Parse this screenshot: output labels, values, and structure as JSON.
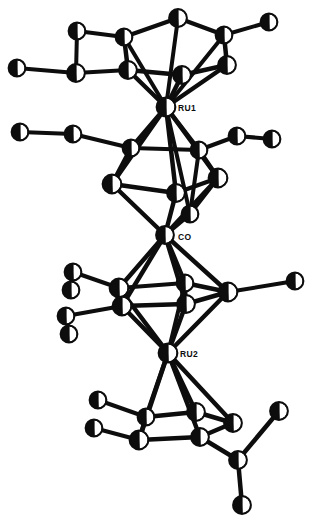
{
  "figure": {
    "type": "crystallographic-structure-diagram",
    "background_color": "#ffffff",
    "line_color": "#0d0d0d",
    "atom_fill_color": "#0d0d0d",
    "atom_highlight_color": "#ffffff",
    "width": 314,
    "height": 530
  },
  "labels": [
    {
      "id": "label-ru1",
      "text": "RU1",
      "x": 178,
      "y": 111
    },
    {
      "id": "label-co",
      "text": "CO",
      "x": 178,
      "y": 240
    },
    {
      "id": "label-ru2",
      "text": "RU2",
      "x": 180,
      "y": 357
    }
  ],
  "metal_atoms": [
    {
      "id": "RU1",
      "label": "RU1",
      "x": 166,
      "y": 107,
      "r": 9.5
    },
    {
      "id": "CO",
      "label": "CO",
      "x": 165,
      "y": 235,
      "r": 9.0
    },
    {
      "id": "RU2",
      "label": "RU2",
      "x": 168,
      "y": 353,
      "r": 9.5
    }
  ],
  "atoms": [
    {
      "id": "C1",
      "x": 178,
      "y": 18,
      "r": 9.0
    },
    {
      "id": "C2",
      "x": 124,
      "y": 37,
      "r": 8.5
    },
    {
      "id": "C3",
      "x": 224,
      "y": 35,
      "r": 8.5
    },
    {
      "id": "C4",
      "x": 128,
      "y": 70,
      "r": 9.0
    },
    {
      "id": "C5",
      "x": 227,
      "y": 65,
      "r": 9.0
    },
    {
      "id": "C6",
      "x": 182,
      "y": 75,
      "r": 9.0
    },
    {
      "id": "M1",
      "x": 77,
      "y": 31,
      "r": 8.5
    },
    {
      "id": "M2",
      "x": 269,
      "y": 22,
      "r": 8.5
    },
    {
      "id": "M3",
      "x": 17,
      "y": 68,
      "r": 8.5
    },
    {
      "id": "M4",
      "x": 76,
      "y": 73,
      "r": 9.0
    },
    {
      "id": "B1",
      "x": 131,
      "y": 148,
      "r": 8.5
    },
    {
      "id": "B2",
      "x": 199,
      "y": 150,
      "r": 8.5
    },
    {
      "id": "B3",
      "x": 112,
      "y": 184,
      "r": 9.5
    },
    {
      "id": "B4",
      "x": 218,
      "y": 178,
      "r": 9.5
    },
    {
      "id": "B5",
      "x": 176,
      "y": 193,
      "r": 9.0
    },
    {
      "id": "B6",
      "x": 190,
      "y": 214,
      "r": 8.5
    },
    {
      "id": "M5",
      "x": 73,
      "y": 134,
      "r": 8.5
    },
    {
      "id": "M6",
      "x": 20,
      "y": 132,
      "r": 8.5
    },
    {
      "id": "M7",
      "x": 237,
      "y": 136,
      "r": 8.5
    },
    {
      "id": "M8",
      "x": 272,
      "y": 139,
      "r": 8.5
    },
    {
      "id": "D1",
      "x": 119,
      "y": 288,
      "r": 9.5
    },
    {
      "id": "D2",
      "x": 122,
      "y": 306,
      "r": 9.5
    },
    {
      "id": "D3",
      "x": 185,
      "y": 283,
      "r": 8.5
    },
    {
      "id": "D4",
      "x": 186,
      "y": 304,
      "r": 9.0
    },
    {
      "id": "D5",
      "x": 228,
      "y": 292,
      "r": 9.5
    },
    {
      "id": "M9",
      "x": 73,
      "y": 272,
      "r": 8.5
    },
    {
      "id": "M10",
      "x": 71,
      "y": 290,
      "r": 8.5
    },
    {
      "id": "M11",
      "x": 66,
      "y": 316,
      "r": 8.5
    },
    {
      "id": "M12",
      "x": 69,
      "y": 334,
      "r": 8.5
    },
    {
      "id": "M13",
      "x": 295,
      "y": 281,
      "r": 8.5
    },
    {
      "id": "E1",
      "x": 146,
      "y": 417,
      "r": 8.5
    },
    {
      "id": "E2",
      "x": 139,
      "y": 440,
      "r": 9.5
    },
    {
      "id": "E3",
      "x": 196,
      "y": 412,
      "r": 9.0
    },
    {
      "id": "E4",
      "x": 200,
      "y": 437,
      "r": 9.0
    },
    {
      "id": "E5",
      "x": 233,
      "y": 423,
      "r": 9.0
    },
    {
      "id": "M14",
      "x": 98,
      "y": 400,
      "r": 8.5
    },
    {
      "id": "M15",
      "x": 94,
      "y": 428,
      "r": 8.5
    },
    {
      "id": "M16",
      "x": 238,
      "y": 460,
      "r": 9.0
    },
    {
      "id": "M17",
      "x": 279,
      "y": 411,
      "r": 9.0
    },
    {
      "id": "M18",
      "x": 242,
      "y": 505,
      "r": 9.0
    }
  ],
  "bonds": [
    {
      "from": "C1",
      "to": "C2",
      "w": 4.5
    },
    {
      "from": "C1",
      "to": "C3",
      "w": 4.5
    },
    {
      "from": "C2",
      "to": "C4",
      "w": 4.5
    },
    {
      "from": "C3",
      "to": "C5",
      "w": 4.5
    },
    {
      "from": "C4",
      "to": "C6",
      "w": 4.5
    },
    {
      "from": "C5",
      "to": "C6",
      "w": 4.5
    },
    {
      "from": "C2",
      "to": "M1",
      "w": 4.0
    },
    {
      "from": "C3",
      "to": "M2",
      "w": 4.0
    },
    {
      "from": "C4",
      "to": "M4",
      "w": 4.0
    },
    {
      "from": "M4",
      "to": "M3",
      "w": 4.0
    },
    {
      "from": "M1",
      "to": "M4",
      "w": 4.0
    },
    {
      "from": "C1",
      "to": "RU1",
      "w": 4.0
    },
    {
      "from": "C2",
      "to": "RU1",
      "w": 4.0
    },
    {
      "from": "C3",
      "to": "RU1",
      "w": 4.0
    },
    {
      "from": "C4",
      "to": "RU1",
      "w": 4.5
    },
    {
      "from": "C5",
      "to": "RU1",
      "w": 4.5
    },
    {
      "from": "C6",
      "to": "RU1",
      "w": 4.5
    },
    {
      "from": "RU1",
      "to": "B1",
      "w": 4.5
    },
    {
      "from": "RU1",
      "to": "B2",
      "w": 4.5
    },
    {
      "from": "RU1",
      "to": "B3",
      "w": 4.5
    },
    {
      "from": "RU1",
      "to": "B4",
      "w": 4.5
    },
    {
      "from": "RU1",
      "to": "B5",
      "w": 4.5
    },
    {
      "from": "RU1",
      "to": "B6",
      "w": 4.0
    },
    {
      "from": "B1",
      "to": "B2",
      "w": 4.0
    },
    {
      "from": "B1",
      "to": "B3",
      "w": 4.5
    },
    {
      "from": "B2",
      "to": "B4",
      "w": 4.5
    },
    {
      "from": "B3",
      "to": "B5",
      "w": 4.5
    },
    {
      "from": "B4",
      "to": "B5",
      "w": 4.5
    },
    {
      "from": "B2",
      "to": "B6",
      "w": 4.0
    },
    {
      "from": "B4",
      "to": "B6",
      "w": 4.0
    },
    {
      "from": "B1",
      "to": "M5",
      "w": 4.0
    },
    {
      "from": "M5",
      "to": "M6",
      "w": 4.0
    },
    {
      "from": "B2",
      "to": "M7",
      "w": 4.0
    },
    {
      "from": "M7",
      "to": "M8",
      "w": 4.0
    },
    {
      "from": "B3",
      "to": "CO",
      "w": 4.5
    },
    {
      "from": "B4",
      "to": "CO",
      "w": 4.5
    },
    {
      "from": "B5",
      "to": "CO",
      "w": 4.5
    },
    {
      "from": "B6",
      "to": "CO",
      "w": 4.5
    },
    {
      "from": "CO",
      "to": "D1",
      "w": 4.5
    },
    {
      "from": "CO",
      "to": "D2",
      "w": 4.5
    },
    {
      "from": "CO",
      "to": "D3",
      "w": 4.5
    },
    {
      "from": "CO",
      "to": "D4",
      "w": 4.5
    },
    {
      "from": "CO",
      "to": "D5",
      "w": 4.5
    },
    {
      "from": "D1",
      "to": "D3",
      "w": 4.0
    },
    {
      "from": "D2",
      "to": "D4",
      "w": 4.5
    },
    {
      "from": "D3",
      "to": "D5",
      "w": 4.5
    },
    {
      "from": "D4",
      "to": "D5",
      "w": 4.5
    },
    {
      "from": "D1",
      "to": "D2",
      "w": 4.5
    },
    {
      "from": "D3",
      "to": "D4",
      "w": 4.0
    },
    {
      "from": "D1",
      "to": "M9",
      "w": 4.0
    },
    {
      "from": "M9",
      "to": "M10",
      "w": 4.0
    },
    {
      "from": "D2",
      "to": "M11",
      "w": 4.0
    },
    {
      "from": "M11",
      "to": "M12",
      "w": 4.0
    },
    {
      "from": "D5",
      "to": "M13",
      "w": 4.0
    },
    {
      "from": "D1",
      "to": "RU2",
      "w": 4.5
    },
    {
      "from": "D2",
      "to": "RU2",
      "w": 4.5
    },
    {
      "from": "D4",
      "to": "RU2",
      "w": 4.5
    },
    {
      "from": "D5",
      "to": "RU2",
      "w": 4.5
    },
    {
      "from": "D3",
      "to": "RU2",
      "w": 4.0
    },
    {
      "from": "RU2",
      "to": "E1",
      "w": 4.5
    },
    {
      "from": "RU2",
      "to": "E2",
      "w": 4.5
    },
    {
      "from": "RU2",
      "to": "E3",
      "w": 4.5
    },
    {
      "from": "RU2",
      "to": "E4",
      "w": 4.5
    },
    {
      "from": "RU2",
      "to": "E5",
      "w": 4.5
    },
    {
      "from": "E1",
      "to": "E3",
      "w": 4.5
    },
    {
      "from": "E2",
      "to": "E4",
      "w": 4.5
    },
    {
      "from": "E3",
      "to": "E5",
      "w": 4.5
    },
    {
      "from": "E4",
      "to": "E5",
      "w": 4.5
    },
    {
      "from": "E1",
      "to": "E2",
      "w": 4.5
    },
    {
      "from": "E1",
      "to": "M14",
      "w": 4.0
    },
    {
      "from": "E2",
      "to": "M15",
      "w": 4.0
    },
    {
      "from": "E4",
      "to": "M16",
      "w": 4.5
    },
    {
      "from": "M16",
      "to": "M17",
      "w": 4.5
    },
    {
      "from": "M16",
      "to": "M18",
      "w": 4.5
    }
  ]
}
